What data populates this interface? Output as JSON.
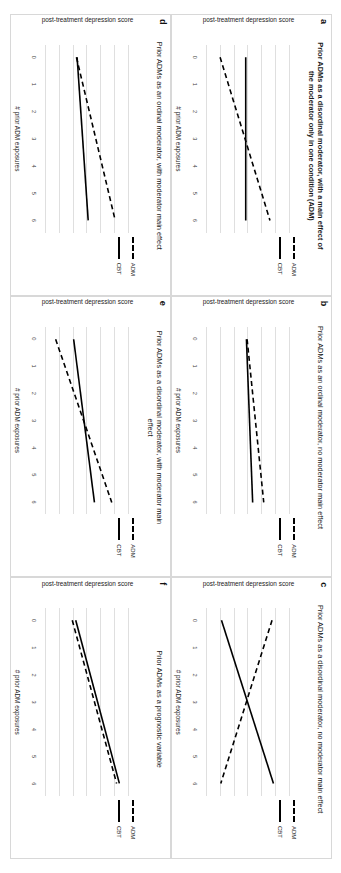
{
  "figure": {
    "ylabel": "post-treatment depression score",
    "xlabel": "# prior ADM exposures",
    "yticks": [
      "16",
      "14",
      "12",
      "10",
      "8",
      "6",
      "4"
    ],
    "xticks": [
      "0",
      "1",
      "2",
      "3",
      "4",
      "5",
      "6"
    ],
    "legend": [
      {
        "key": "adm",
        "label": "ADM",
        "style": "dashed"
      },
      {
        "key": "cbt",
        "label": "CBT",
        "style": "solid"
      }
    ]
  },
  "chart_data": [
    {
      "panel": "a",
      "type": "line",
      "title": "Prior ADMs as a disordinal moderator, with a main effect of the moderator only in one condition (ADM)",
      "bold_title": true,
      "xlabel": "# prior ADM exposures",
      "ylabel": "post-treatment depression score",
      "x": [
        0,
        6
      ],
      "xlim": [
        -0.45,
        6.45
      ],
      "ylim": [
        3,
        17
      ],
      "grid": true,
      "legend_position": "right",
      "series": [
        {
          "name": "ADM",
          "style": "dashed",
          "values": [
            5.9,
            13.1
          ]
        },
        {
          "name": "CBT",
          "style": "solid",
          "values": [
            9.6,
            9.6
          ]
        }
      ]
    },
    {
      "panel": "b",
      "type": "line",
      "title": "Prior ADMs as an ordinal moderator, no moderator main effect",
      "bold_title": false,
      "xlabel": "# prior ADM exposures",
      "ylabel": "post-treatment depression score",
      "x": [
        0,
        6
      ],
      "xlim": [
        -0.45,
        6.45
      ],
      "ylim": [
        3,
        17
      ],
      "grid": true,
      "legend_position": "right",
      "series": [
        {
          "name": "ADM",
          "style": "dashed",
          "values": [
            9.8,
            12.2
          ]
        },
        {
          "name": "CBT",
          "style": "solid",
          "values": [
            9.7,
            10.6
          ]
        }
      ]
    },
    {
      "panel": "c",
      "type": "line",
      "title": "Prior ADMs as a disordinal moderator, no moderator main effect",
      "bold_title": false,
      "xlabel": "# prior ADM exposures",
      "ylabel": "post-treatment depression score",
      "x": [
        0,
        6
      ],
      "xlim": [
        -0.45,
        6.45
      ],
      "ylim": [
        3,
        17
      ],
      "grid": true,
      "legend_position": "right",
      "series": [
        {
          "name": "ADM",
          "style": "dashed",
          "values": [
            13.4,
            6.0
          ]
        },
        {
          "name": "CBT",
          "style": "solid",
          "values": [
            6.1,
            13.6
          ]
        }
      ]
    },
    {
      "panel": "d",
      "type": "line",
      "title": "Prior ADMs as an ordinal moderator, with moderator main effect",
      "bold_title": false,
      "xlabel": "# prior ADM exposures",
      "ylabel": "post-treatment depression score",
      "x": [
        0,
        6
      ],
      "xlim": [
        -0.45,
        6.45
      ],
      "ylim": [
        3,
        17
      ],
      "grid": true,
      "legend_position": "right",
      "series": [
        {
          "name": "ADM",
          "style": "dashed",
          "values": [
            8.4,
            14.0
          ]
        },
        {
          "name": "CBT",
          "style": "solid",
          "values": [
            8.5,
            10.1
          ]
        }
      ]
    },
    {
      "panel": "e",
      "type": "line",
      "title": "Prior ADMs as a disordinal moderator, with moderator main effect",
      "bold_title": false,
      "xlabel": "# prior ADM exposures",
      "ylabel": "post-treatment depression score",
      "x": [
        0,
        6
      ],
      "xlim": [
        -0.45,
        6.45
      ],
      "ylim": [
        3,
        17
      ],
      "grid": true,
      "legend_position": "right",
      "series": [
        {
          "name": "ADM",
          "style": "dashed",
          "values": [
            5.4,
            13.5
          ]
        },
        {
          "name": "CBT",
          "style": "solid",
          "values": [
            8.0,
            11.0
          ]
        }
      ]
    },
    {
      "panel": "f",
      "type": "line",
      "title": "Prior ADMs as a prognostic variable",
      "bold_title": false,
      "xlabel": "# prior ADM exposures",
      "ylabel": "post-treatment depression score",
      "x": [
        0,
        6
      ],
      "xlim": [
        -0.45,
        6.45
      ],
      "ylim": [
        3,
        17
      ],
      "grid": true,
      "legend_position": "right",
      "series": [
        {
          "name": "ADM",
          "style": "dashed",
          "values": [
            7.8,
            14.2
          ]
        },
        {
          "name": "CBT",
          "style": "solid",
          "values": [
            8.3,
            14.6
          ]
        }
      ]
    }
  ]
}
